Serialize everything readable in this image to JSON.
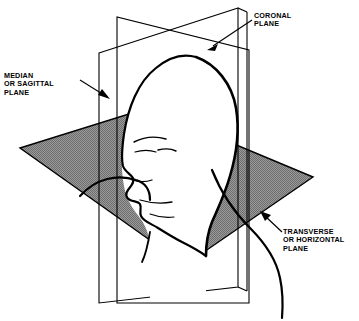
{
  "figure": {
    "background_color": "#ffffff",
    "ink_color": "#000000",
    "plane_fill_color": "#8a8a8a",
    "width": 359,
    "height": 321
  },
  "labels": {
    "coronal": {
      "name": "coronal-plane-label",
      "lines": [
        "CORONAL",
        "PLANE"
      ],
      "line1": "CORONAL",
      "line2": "PLANE"
    },
    "median": {
      "name": "median-sagittal-plane-label",
      "lines": [
        "MEDIAN",
        "OR SAGITTAL",
        "PLANE"
      ],
      "line1": "MEDIAN",
      "line2": "OR SAGITTAL",
      "line3": "PLANE"
    },
    "transverse": {
      "name": "transverse-horizontal-plane-label",
      "lines": [
        "TRANSVERSE",
        "OR HORIZONTAL",
        "PLANE"
      ],
      "line1": "TRANSVERSE",
      "line2": "OR HORIZONTAL",
      "line3": "PLANE"
    }
  },
  "planes": [
    {
      "id": "median-sagittal",
      "label": "MEDIAN OR SAGITTAL PLANE",
      "orientation": "vertical-longitudinal",
      "fill": "none",
      "stroke": "#000000",
      "divides": "left and right"
    },
    {
      "id": "coronal",
      "label": "CORONAL PLANE",
      "orientation": "vertical-frontal",
      "fill": "none",
      "stroke": "#000000",
      "divides": "anterior and posterior"
    },
    {
      "id": "transverse-horizontal",
      "label": "TRANSVERSE OR HORIZONTAL PLANE",
      "orientation": "horizontal",
      "fill": "#8a8a8a",
      "stroke": "#000000",
      "divides": "superior and inferior"
    }
  ]
}
